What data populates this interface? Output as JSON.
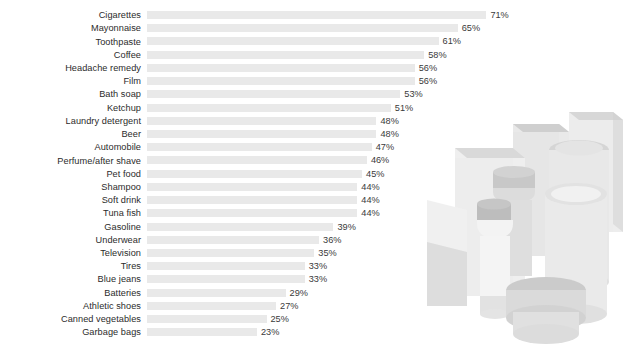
{
  "chart_data": {
    "type": "bar",
    "orientation": "horizontal",
    "title": "",
    "subtitle": "",
    "xlabel": "",
    "ylabel": "",
    "xlim": [
      0,
      71
    ],
    "grid": false,
    "legend": "none",
    "value_suffix": "%",
    "categories": [
      "Cigarettes",
      "Mayonnaise",
      "Toothpaste",
      "Coffee",
      "Headache remedy",
      "Film",
      "Bath soap",
      "Ketchup",
      "Laundry detergent",
      "Beer",
      "Automobile",
      "Perfume/after shave",
      "Pet food",
      "Shampoo",
      "Soft drink",
      "Tuna fish",
      "Gasoline",
      "Underwear",
      "Television",
      "Tires",
      "Blue jeans",
      "Batteries",
      "Athletic shoes",
      "Canned vegetables",
      "Garbage bags"
    ],
    "values": [
      71,
      65,
      61,
      58,
      56,
      56,
      53,
      51,
      48,
      48,
      47,
      46,
      45,
      44,
      44,
      44,
      39,
      36,
      35,
      33,
      33,
      29,
      27,
      25,
      23
    ],
    "value_labels": [
      "71%",
      "65%",
      "61%",
      "58%",
      "56%",
      "56%",
      "53%",
      "51%",
      "48%",
      "48%",
      "47%",
      "46%",
      "45%",
      "44%",
      "44%",
      "44%",
      "39%",
      "36%",
      "35%",
      "33%",
      "33%",
      "29%",
      "27%",
      "25%",
      "23%"
    ],
    "bar_color": "#e9e9e9",
    "label_color": "#2b2b2b",
    "value_color": "#3a3a3a",
    "background_color": "#ffffff"
  },
  "illustration": {
    "name": "product-containers-illustration",
    "description": "Grayscale illustration of assorted consumer product containers, bottles, jars and boxes",
    "palette": {
      "lightest": "#f2f2f2",
      "light": "#e6e6e6",
      "mid": "#dcdcdc",
      "midgray": "#cfcfcf",
      "dark": "#bdbdbd",
      "darkest": "#ababab"
    }
  }
}
